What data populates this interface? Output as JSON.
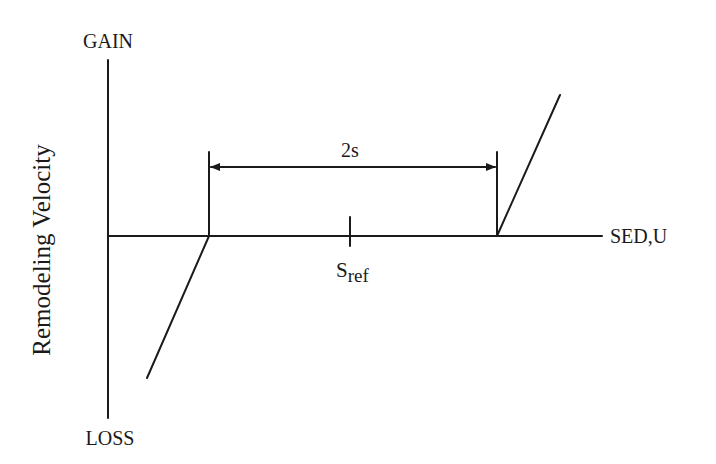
{
  "diagram": {
    "title": "",
    "y_axis": {
      "label": "Remodeling Velocity",
      "top_label": "GAIN",
      "bottom_label": "LOSS"
    },
    "x_axis": {
      "label": "SED,U"
    },
    "dead_zone": {
      "width_label": "2s",
      "center_label_main": "S",
      "center_label_sub": "ref"
    },
    "segments": [
      {
        "name": "resorption-branch",
        "from": [
          147,
          378
        ],
        "to": [
          209,
          236
        ]
      },
      {
        "name": "lazy-zone",
        "from": [
          209,
          236
        ],
        "to": [
          497,
          236
        ]
      },
      {
        "name": "formation-branch",
        "from": [
          497,
          236
        ],
        "to": [
          560,
          95
        ]
      }
    ],
    "colors": {
      "ink": "#1a1a1a",
      "background": "#ffffff"
    }
  }
}
